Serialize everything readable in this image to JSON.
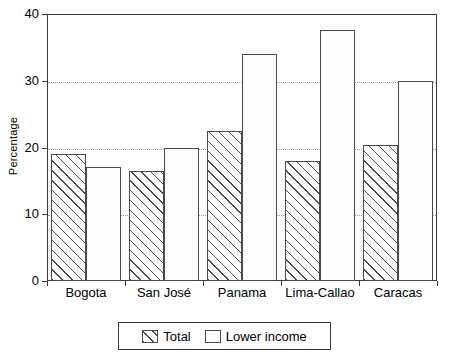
{
  "chart_data": {
    "type": "bar",
    "title": "",
    "xlabel": "",
    "ylabel": "Percentage",
    "ylim": [
      0,
      40
    ],
    "yticks": [
      0,
      10,
      20,
      30,
      40
    ],
    "ytick_labels": [
      "0",
      "10",
      "20",
      "30",
      "40"
    ],
    "gridlines": [
      10,
      20,
      30
    ],
    "grid": true,
    "grid_style": "dotted",
    "legend_position": "below-axis-centered",
    "categories": [
      "Bogota",
      "San José",
      "Panama",
      "Lima-Callao",
      "Caracas"
    ],
    "series": [
      {
        "name": "Total",
        "fill": "diagonal-hatch",
        "values": [
          19.0,
          16.5,
          22.4,
          18.0,
          20.4
        ]
      },
      {
        "name": "Lower income",
        "fill": "dotted",
        "values": [
          17.1,
          20.0,
          34.0,
          37.6,
          30.0
        ]
      }
    ]
  },
  "axes": {
    "y_title": "Percentage"
  },
  "colors": {
    "frame": "#3a3a3a",
    "bar_outline": "#4a4a4a",
    "grid": "#9a9a9a",
    "hatch": "#4a4a4a",
    "dots": "#8a8a8a",
    "background": "#ffffff",
    "text": "#000000"
  }
}
